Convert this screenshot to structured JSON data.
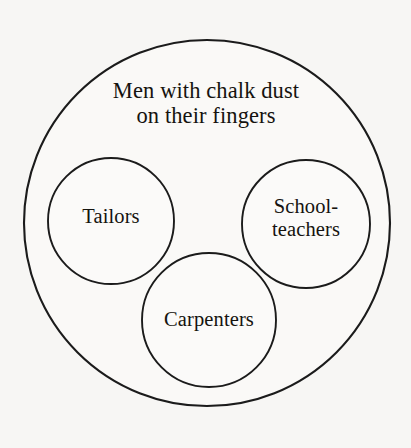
{
  "figure": {
    "type": "euler-diagram",
    "background_color": "#f7f6f4",
    "stroke_color": "#1b1b1b",
    "text_color": "#15130f",
    "universe": {
      "name": "men-with-chalk-dust",
      "label": "Men with chalk dust\non their fingers",
      "label_line_1": "Men with chalk dust",
      "label_line_2": "on their fingers",
      "center_x": 207,
      "center_y": 223,
      "radius": 183
    },
    "subsets": [
      {
        "name": "tailors",
        "label": "Tailors",
        "center_x": 111,
        "center_y": 221,
        "radius": 63
      },
      {
        "name": "schoolteachers",
        "label": "School-\nteachers",
        "label_line_1": "School-",
        "label_line_2": "teachers",
        "center_x": 306,
        "center_y": 224,
        "radius": 64
      },
      {
        "name": "carpenters",
        "label": "Carpenters",
        "center_x": 209,
        "center_y": 320,
        "radius": 67
      }
    ]
  }
}
